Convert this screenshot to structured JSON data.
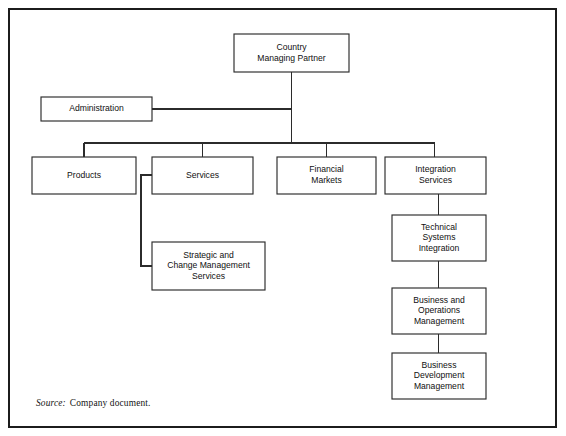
{
  "figure": {
    "type": "organization-chart",
    "source_label": "Source:",
    "source_text": "Company document.",
    "line_color": "#2b2b2b",
    "box_fill": "#ffffff",
    "frame_color": "#1c1c1c"
  },
  "nodes": [
    {
      "id": "country-managing-partner",
      "lines": [
        "Country",
        "Managing Partner"
      ],
      "x": 224,
      "y": 24,
      "w": 115,
      "h": 38,
      "level": "root"
    },
    {
      "id": "administration",
      "lines": [
        "Administration"
      ],
      "x": 31,
      "y": 87,
      "w": 111,
      "h": 24,
      "level": "staff"
    },
    {
      "id": "products",
      "lines": [
        "Products"
      ],
      "x": 22,
      "y": 147,
      "w": 104,
      "h": 37,
      "level": "division"
    },
    {
      "id": "services",
      "lines": [
        "Services"
      ],
      "x": 142,
      "y": 147,
      "w": 101,
      "h": 37,
      "level": "division"
    },
    {
      "id": "financial-markets",
      "lines": [
        "Financial",
        "Markets"
      ],
      "x": 267,
      "y": 147,
      "w": 99,
      "h": 37,
      "level": "division"
    },
    {
      "id": "integration-services",
      "lines": [
        "Integration",
        "Services"
      ],
      "x": 375,
      "y": 147,
      "w": 101,
      "h": 37,
      "level": "division"
    },
    {
      "id": "strategic-and-change-management-services",
      "lines": [
        "Strategic and",
        "Change Management",
        "Services"
      ],
      "x": 142,
      "y": 232,
      "w": 113,
      "h": 48,
      "level": "sub"
    },
    {
      "id": "technical-systems-integration",
      "lines": [
        "Technical",
        "Systems",
        "Integration"
      ],
      "x": 382,
      "y": 205,
      "w": 94,
      "h": 46,
      "level": "sub"
    },
    {
      "id": "business-and-operations-management",
      "lines": [
        "Business and",
        "Operations",
        "Management"
      ],
      "x": 382,
      "y": 278,
      "w": 94,
      "h": 46,
      "level": "sub"
    },
    {
      "id": "business-development-management",
      "lines": [
        "Business",
        "Development",
        "Management"
      ],
      "x": 382,
      "y": 343,
      "w": 94,
      "h": 46,
      "level": "sub"
    }
  ],
  "connectors": [
    {
      "id": "root-stem",
      "points": "281.5,62 281.5,133"
    },
    {
      "id": "administration-staff-line",
      "points": "142,99 281.5,99"
    },
    {
      "id": "division-bus",
      "points": "74,133 424.5,133"
    },
    {
      "id": "drop-products",
      "points": "74,133 74,147"
    },
    {
      "id": "drop-services",
      "points": "192.5,133 192.5,147"
    },
    {
      "id": "drop-financial-markets",
      "points": "316.5,133 316.5,147"
    },
    {
      "id": "drop-integration-services",
      "points": "424.5,133 424.5,147"
    },
    {
      "id": "services-to-strategic-elbow",
      "points": "142,165 131,165 131,256 142,256"
    },
    {
      "id": "integration-to-technical",
      "points": "428.5,184 428.5,205"
    },
    {
      "id": "technical-to-business-ops",
      "points": "428.5,251 428.5,278"
    },
    {
      "id": "business-ops-to-business-dev",
      "points": "428.5,324 428.5,343"
    }
  ]
}
